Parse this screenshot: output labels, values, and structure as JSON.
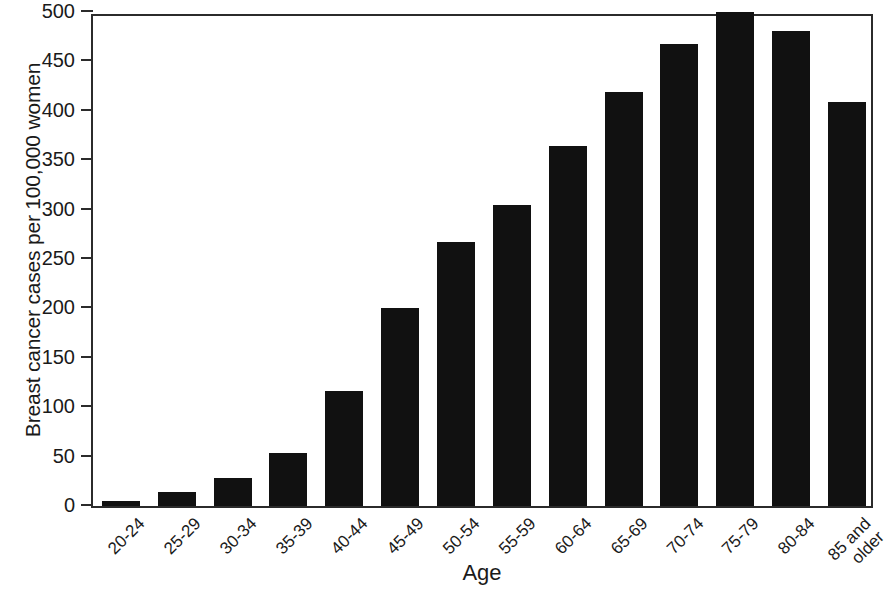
{
  "chart_data": {
    "type": "bar",
    "title": "",
    "xlabel": "Age",
    "ylabel": "Breast cancer cases per 100,000 women",
    "categories": [
      "20-24",
      "25-29",
      "30-34",
      "35-39",
      "40-44",
      "45-49",
      "50-54",
      "55-59",
      "60-64",
      "65-69",
      "70-74",
      "75-79",
      "80-84",
      "85 and\nolder"
    ],
    "values": [
      5,
      14,
      28,
      54,
      116,
      200,
      267,
      305,
      364,
      419,
      468,
      500,
      481,
      409
    ],
    "ylim": [
      0,
      500
    ],
    "yticks": [
      0,
      50,
      100,
      150,
      200,
      250,
      300,
      350,
      400,
      450,
      500
    ],
    "ytick_labels": [
      "0",
      "50",
      "100",
      "150",
      "200",
      "250",
      "300",
      "350",
      "400",
      "450",
      "500"
    ],
    "grid": false,
    "legend": false,
    "bar_color": "#111111",
    "axis_color": "#2b2b2b",
    "background_color": "#ffffff"
  }
}
